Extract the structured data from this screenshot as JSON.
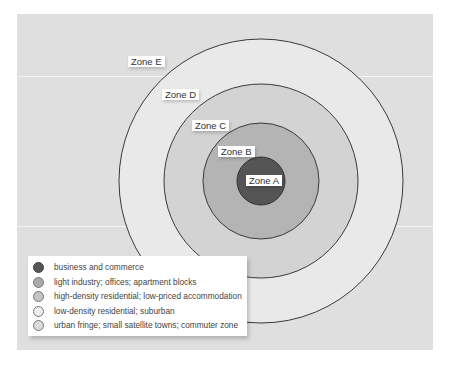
{
  "diagram": {
    "type": "concentric-zone-model",
    "center": [
      261,
      181
    ],
    "zones": [
      {
        "id": "E",
        "label": "Zone E",
        "radius": 142,
        "fill": "#e9e9e9",
        "description": "urban fringe; small satellite towns; commuter zone"
      },
      {
        "id": "D",
        "label": "Zone D",
        "radius": 97,
        "fill": "#d3d3d3",
        "description": "low-density residential; suburban"
      },
      {
        "id": "C",
        "label": "Zone C",
        "radius": 58,
        "fill": "#c5c5c5",
        "description": "high-density residential; low-priced accommodation"
      },
      {
        "id": "B",
        "label": "Zone B",
        "radius": 58,
        "fill": "#b2b2b2",
        "description": "light industry; offices; apartment blocks"
      },
      {
        "id": "A",
        "label": "Zone A",
        "radius": 24,
        "fill": "#555555",
        "description": "business and commerce"
      }
    ]
  },
  "labels": {
    "zone_e": "Zone E",
    "zone_d": "Zone D",
    "zone_c": "Zone C",
    "zone_b": "Zone B",
    "zone_a": "Zone A"
  },
  "legend": {
    "items": [
      {
        "label": "business and commerce",
        "color": "#555555"
      },
      {
        "label": "light industry; offices; apartment blocks",
        "color": "#aaaaaa"
      },
      {
        "label": "high-density residential; low-priced accommodation",
        "color": "#c4c4c4"
      },
      {
        "label": "low-density residential; suburban",
        "color": "#ececec"
      },
      {
        "label": "urban fringe; small satellite towns; commuter zone",
        "color": "#dadada"
      }
    ]
  }
}
